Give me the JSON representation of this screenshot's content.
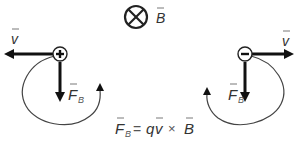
{
  "field": {
    "symbol": "into-page-icon",
    "label": "B",
    "has_vector_arrow": true
  },
  "positive_charge": {
    "sign": "+",
    "velocity_label": "v",
    "velocity_direction": "left",
    "force_label": "F",
    "force_subscript": "B",
    "force_direction": "down",
    "rotation": "counterclockwise"
  },
  "negative_charge": {
    "sign": "−",
    "velocity_label": "v",
    "velocity_direction": "right",
    "force_label": "F",
    "force_subscript": "B",
    "force_direction": "down",
    "rotation": "clockwise"
  },
  "equation": {
    "lhs": "F",
    "lhs_subscript": "B",
    "equals": "=",
    "q": "q",
    "v": "v",
    "cross": "×",
    "b": "B"
  },
  "colors": {
    "stroke": "#111111",
    "text": "#333333",
    "path": "#444444"
  }
}
